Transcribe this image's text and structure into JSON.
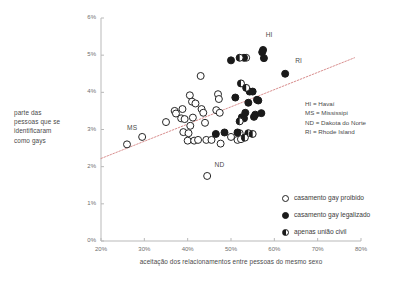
{
  "chart_data": {
    "type": "scatter",
    "title": "",
    "xlabel": "aceitação dos relacionamentos entre pessoas do mesmo sexo",
    "ylabel": "parte das pessoas que se identificaram como gays",
    "xlim": [
      20,
      80
    ],
    "ylim": [
      0,
      6
    ],
    "xticks": [
      "20%",
      "30%",
      "40%",
      "50%",
      "60%",
      "70%",
      "80%"
    ],
    "yticks": [
      "0%",
      "1%",
      "2%",
      "3%",
      "4%",
      "5%",
      "6%"
    ],
    "grid": false,
    "legend_position": "lower-right",
    "series": [
      {
        "name": "casamento gay proibido",
        "marker": "open-circle",
        "color": "#ffffff",
        "edge_color": "#222222",
        "points": [
          [
            26.0,
            2.6
          ],
          [
            29.5,
            2.8
          ],
          [
            35.0,
            3.2
          ],
          [
            37.0,
            3.5
          ],
          [
            37.3,
            3.43
          ],
          [
            38.5,
            3.3
          ],
          [
            39.3,
            3.28
          ],
          [
            38.8,
            3.55
          ],
          [
            39.0,
            2.93
          ],
          [
            40.5,
            3.92
          ],
          [
            41.0,
            3.75
          ],
          [
            41.8,
            3.7
          ],
          [
            41.2,
            3.32
          ],
          [
            40.6,
            3.1
          ],
          [
            40.2,
            2.9
          ],
          [
            40.0,
            2.7
          ],
          [
            41.5,
            2.7
          ],
          [
            42.4,
            2.72
          ],
          [
            43.0,
            4.44
          ],
          [
            43.2,
            3.55
          ],
          [
            43.6,
            3.45
          ],
          [
            44.0,
            3.18
          ],
          [
            44.3,
            2.72
          ],
          [
            44.5,
            1.75
          ],
          [
            45.5,
            2.72
          ],
          [
            46.6,
            3.52
          ],
          [
            47.0,
            3.95
          ],
          [
            47.2,
            3.82
          ],
          [
            47.4,
            3.45
          ],
          [
            47.6,
            2.62
          ],
          [
            50.0,
            2.8
          ],
          [
            51.5,
            2.72
          ],
          [
            52.0,
            2.9
          ],
          [
            52.3,
            2.74
          ],
          [
            53.5,
            4.93
          ]
        ]
      },
      {
        "name": "casamento gay legalizado",
        "marker": "filled-circle",
        "color": "#1a1a1a",
        "edge_color": "#1a1a1a",
        "points": [
          [
            46.5,
            2.88
          ],
          [
            48.5,
            2.92
          ],
          [
            50.0,
            4.86
          ],
          [
            51.0,
            3.86
          ],
          [
            51.5,
            2.92
          ],
          [
            52.5,
            3.33
          ],
          [
            53.0,
            3.3
          ],
          [
            53.3,
            3.45
          ],
          [
            54.0,
            3.72
          ],
          [
            54.3,
            4.02
          ],
          [
            55.0,
            4.02
          ],
          [
            55.3,
            3.34
          ],
          [
            55.6,
            3.4
          ],
          [
            56.0,
            3.8
          ],
          [
            56.3,
            3.78
          ],
          [
            57.0,
            3.44
          ],
          [
            57.2,
            5.08
          ],
          [
            57.4,
            5.14
          ],
          [
            57.6,
            4.92
          ],
          [
            53.0,
            4.93
          ],
          [
            62.5,
            4.5
          ]
        ]
      },
      {
        "name": "apenas união civil",
        "marker": "half-filled-circle",
        "color": "#1a1a1a",
        "edge_color": "#1a1a1a",
        "points": [
          [
            52.0,
            4.93
          ],
          [
            52.3,
            4.24
          ],
          [
            52.0,
            3.22
          ],
          [
            53.5,
            4.12
          ],
          [
            54.0,
            2.9
          ],
          [
            55.0,
            2.88
          ],
          [
            53.2,
            2.78
          ]
        ]
      }
    ],
    "trendline": {
      "style": "dotted",
      "color": "#d98f8f",
      "x_start": 20,
      "y_start": 2.22,
      "x_end": 78.5,
      "y_end": 4.93
    },
    "annotations": [
      {
        "text": "MS",
        "x": 26.0,
        "y": 3.02
      },
      {
        "text": "ND",
        "x": 46.2,
        "y": 2.02
      },
      {
        "text": "HI",
        "x": 58.0,
        "y": 5.52
      },
      {
        "text": "RI",
        "x": 64.8,
        "y": 4.82
      }
    ]
  },
  "abbreviation_key": [
    "HI = Havaí",
    "MS = Mississipi",
    "ND = Dakota do Norte",
    "RI = Rhode Island"
  ],
  "legend": {
    "items": [
      {
        "label": "casamento gay proibido",
        "marker": "open-circle"
      },
      {
        "label": "casamento gay legalizado",
        "marker": "filled-circle"
      },
      {
        "label": "apenas união civil",
        "marker": "half-filled-circle"
      }
    ]
  },
  "axis_titles": {
    "y_lines": [
      "parte das",
      "pessoas que se",
      "identificaram",
      "como gays"
    ],
    "x": "aceitação dos relacionamentos entre pessoas do mesmo sexo"
  }
}
